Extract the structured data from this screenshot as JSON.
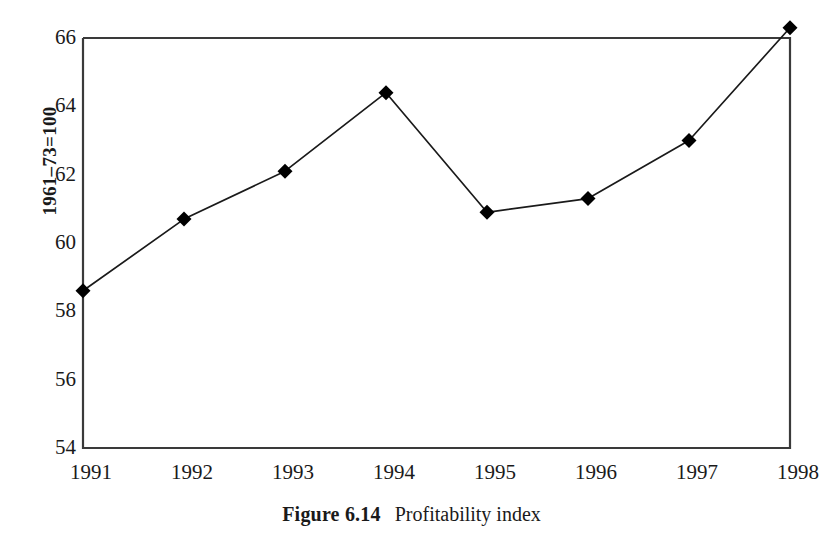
{
  "caption": {
    "label": "Figure 6.14",
    "text": "Profitability index"
  },
  "chart_data": {
    "type": "line",
    "title": "",
    "subtitle": "",
    "xlabel": "",
    "ylabel": "1961–73=100",
    "categories": [
      "1991",
      "1992",
      "1993",
      "1994",
      "1995",
      "1996",
      "1997",
      "1998"
    ],
    "x": [
      1991,
      1992,
      1993,
      1994,
      1995,
      1996,
      1997,
      1998
    ],
    "values": [
      58.6,
      60.7,
      62.1,
      64.4,
      60.9,
      61.3,
      63.0,
      66.3
    ],
    "series": [
      {
        "name": "Profitability index",
        "values": [
          58.6,
          60.7,
          62.1,
          64.4,
          60.9,
          61.3,
          63.0,
          66.3
        ]
      }
    ],
    "ylim": [
      54,
      66
    ],
    "yticks": [
      66,
      64,
      62,
      60,
      58,
      56,
      54
    ],
    "ytick_labels": [
      "66",
      "64",
      "62",
      "60",
      "58",
      "56",
      "54"
    ],
    "xlim": [
      1991,
      1998
    ],
    "grid": false,
    "legend": false,
    "legend_position": "none",
    "marker": "diamond",
    "line_color": "#1a1a1a",
    "marker_color": "#000000",
    "frame_color": "#3a3a3a",
    "background": "#ffffff"
  }
}
